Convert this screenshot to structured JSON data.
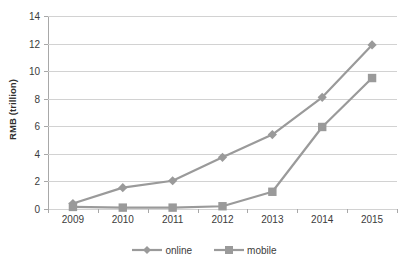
{
  "chart_data": {
    "type": "line",
    "title": "",
    "xlabel": "",
    "ylabel": "RMB (trillion)",
    "categories": [
      "2009",
      "2010",
      "2011",
      "2012",
      "2013",
      "2014",
      "2015"
    ],
    "series": [
      {
        "name": "online",
        "marker": "diamond",
        "color": "#9a9a9a",
        "values": [
          0.4,
          1.55,
          2.05,
          3.75,
          5.4,
          8.1,
          11.9
        ]
      },
      {
        "name": "mobile",
        "marker": "square",
        "color": "#9a9a9a",
        "values": [
          0.15,
          0.1,
          0.1,
          0.2,
          1.25,
          5.95,
          9.5
        ]
      }
    ],
    "ylim": [
      0,
      14
    ],
    "y_ticks": [
      "0",
      "2",
      "4",
      "6",
      "8",
      "10",
      "12",
      "14"
    ],
    "grid": true,
    "legend_position": "bottom",
    "colors": {
      "line": "#9a9a9a",
      "gridline": "#d2d2d2",
      "axis": "#a8a8a8",
      "text": "#3b3b3b"
    }
  },
  "legend": {
    "items": [
      {
        "label": "online"
      },
      {
        "label": "mobile"
      }
    ]
  }
}
